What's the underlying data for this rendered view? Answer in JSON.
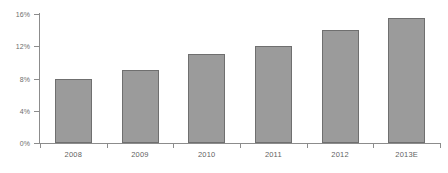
{
  "chart_data": {
    "type": "bar",
    "title": "",
    "subtitle": "",
    "xlabel": "",
    "ylabel": "",
    "categories": [
      "2008",
      "2009",
      "2010",
      "2011",
      "2012",
      "2013E"
    ],
    "values": [
      8,
      9,
      11,
      12,
      14,
      15.5
    ],
    "series": [
      {
        "name": "",
        "values": [
          8,
          9,
          11,
          12,
          14,
          15.5
        ]
      }
    ],
    "ylim": [
      0,
      16
    ],
    "yticks": [
      0,
      4,
      8,
      12,
      16
    ],
    "ytick_labels": [
      "0%",
      "4%",
      "8%",
      "12%",
      "16%"
    ],
    "xtick_labels": [
      "2008",
      "2009",
      "2010",
      "2011",
      "2012",
      "2013E"
    ],
    "value_suffix": "%",
    "grid": false,
    "legend": false,
    "legend_position": "none",
    "annotations": [],
    "colors": {
      "bar_fill": "#9b9b9b",
      "bar_border": "#6f6f6f",
      "axis": "#8c8c8c",
      "tick_label": "#5f5f5f",
      "background": "#ffffff"
    }
  }
}
